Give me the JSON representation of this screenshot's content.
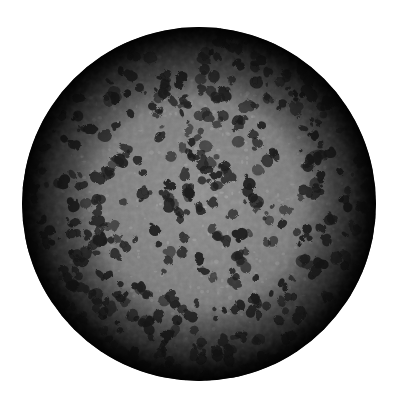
{
  "image": {
    "subject": "textured grayscale sphere",
    "description": "Mottled gray sphere with dark irregular blotches and limb darkening toward the edge, on a white background",
    "background": "#ffffff"
  },
  "sphere": {
    "cx": 199,
    "cy": 204,
    "r": 177,
    "colors": {
      "center": "#8e8e8e",
      "mid": "#7a7a7a",
      "limb": "#1c1c1c",
      "edge": "#050505",
      "speckle": "#b0b0b0",
      "blotch": "#1e1e1e"
    },
    "texture": {
      "blotch_count": 420,
      "speckle_count": 380,
      "seed": 7
    }
  }
}
